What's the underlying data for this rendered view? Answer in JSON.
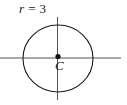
{
  "figure": {
    "background_color": "#ffffff",
    "stroke_color": "#1a1a1a",
    "labels": {
      "radius_variable": "r",
      "radius_equals": "=",
      "radius_value": "3",
      "radius_full": "r = 3",
      "center_point": "C"
    }
  },
  "chart_data": {
    "type": "diagram",
    "subtype": "geometry-circle",
    "title": "",
    "annotations": [
      {
        "name": "radius-label",
        "text": "r = 3",
        "x": 19,
        "y": 2
      },
      {
        "name": "center-label",
        "text": "C",
        "x": 55,
        "y": 59
      }
    ],
    "shapes": [
      {
        "name": "circle",
        "type": "ellipse",
        "cx": 58,
        "cy": 58.5,
        "rx": 35,
        "ry": 33.5,
        "stroke": "#1a1a1a",
        "stroke_width": 1.1,
        "fill": "none"
      },
      {
        "name": "horizontal-axis",
        "type": "line",
        "x1": 0,
        "y1": 58,
        "x2": 121,
        "y2": 58,
        "stroke": "#555555",
        "stroke_width": 1
      },
      {
        "name": "vertical-axis",
        "type": "line",
        "x1": 57.5,
        "y1": 17,
        "x2": 57.5,
        "y2": 100,
        "stroke": "#555555",
        "stroke_width": 1
      },
      {
        "name": "center-point",
        "type": "dot",
        "cx": 58,
        "cy": 56.5,
        "r": 2.6,
        "fill": "#111111"
      }
    ]
  }
}
